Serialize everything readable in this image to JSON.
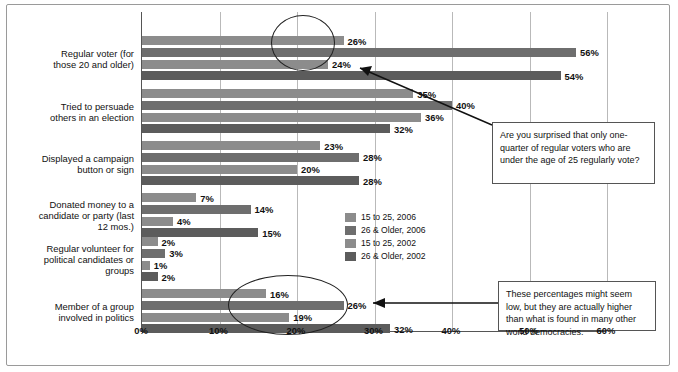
{
  "chart_data": {
    "type": "bar",
    "orientation": "horizontal",
    "title": "",
    "xlabel": "",
    "ylabel": "",
    "xlim": [
      0,
      60
    ],
    "xticks": [
      "0%",
      "10%",
      "20%",
      "30%",
      "40%",
      "50%",
      "60%"
    ],
    "grid": true,
    "legend_position": "inside-right",
    "categories": [
      "Regular voter (for those 20 and older)",
      "Tried to persuade others in an election",
      "Displayed a campaign button or sign",
      "Donated money to a candidate or party (last 12 mos.)",
      "Regular volunteer for political candidates or groups",
      "Member of a group involved in politics"
    ],
    "series": [
      {
        "name": "15 to 25, 2006",
        "color": "#8c8c8c",
        "values": [
          26,
          35,
          23,
          7,
          2,
          16
        ],
        "labels": [
          "26%",
          "35%",
          "23%",
          "7%",
          "2%",
          "16%"
        ]
      },
      {
        "name": "26 & Older, 2006",
        "color": "#6e6e6e",
        "values": [
          56,
          40,
          28,
          14,
          3,
          26
        ],
        "labels": [
          "56%",
          "40%",
          "28%",
          "14%",
          "3%",
          "26%"
        ]
      },
      {
        "name": "15 to 25, 2002",
        "color": "#8c8c8c",
        "values": [
          24,
          36,
          20,
          4,
          1,
          19
        ],
        "labels": [
          "24%",
          "36%",
          "20%",
          "4%",
          "1%",
          "19%"
        ]
      },
      {
        "name": "26 & Older, 2002",
        "color": "#5c5c5c",
        "values": [
          54,
          32,
          28,
          15,
          2,
          32
        ],
        "labels": [
          "54%",
          "32%",
          "28%",
          "15%",
          "2%",
          "32%"
        ]
      }
    ]
  },
  "callouts": [
    {
      "id": "callout-top",
      "text": "Are you surprised that only one-quarter of regular voters who are under the age of 25 regularly vote?"
    },
    {
      "id": "callout-bottom",
      "text": "These percentages might seem low, but they are actually higher than what is found in many other world democracies."
    }
  ],
  "legend": {
    "items": [
      {
        "label": "15 to 25, 2006",
        "color": "#8c8c8c"
      },
      {
        "label": "26 & Older, 2006",
        "color": "#6e6e6e"
      },
      {
        "label": "15 to 25, 2002",
        "color": "#8c8c8c"
      },
      {
        "label": "26 & Older, 2002",
        "color": "#5c5c5c"
      }
    ]
  }
}
